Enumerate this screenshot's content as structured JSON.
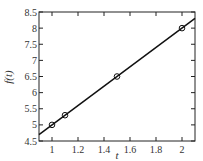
{
  "chart_data": {
    "type": "line",
    "title": "",
    "xlabel": "t",
    "ylabel": "f(t)",
    "xlim": [
      0.9,
      2.1
    ],
    "ylim": [
      4.5,
      8.5
    ],
    "grid": false,
    "legend": null,
    "x_ticks": [
      1,
      1.2,
      1.4,
      1.6,
      1.8,
      2
    ],
    "x_tick_labels": [
      "1",
      "1.2",
      "1.4",
      "1.6",
      "1.8",
      "2"
    ],
    "y_ticks": [
      4.5,
      5,
      5.5,
      6,
      6.5,
      7,
      7.5,
      8,
      8.5
    ],
    "y_tick_labels": [
      "4.5",
      "5",
      "5.5",
      "6",
      "6.5",
      "7",
      "7.5",
      "8",
      "8.5"
    ],
    "series": [
      {
        "name": "fit line",
        "style": "solid line",
        "color": "#111111",
        "x": [
          0.9,
          2.1
        ],
        "y": [
          4.7,
          8.3
        ]
      },
      {
        "name": "data points",
        "style": "open circle markers",
        "color": "#111111",
        "x": [
          1.0,
          1.1,
          1.5,
          2.0
        ],
        "y": [
          5.0,
          5.3,
          6.5,
          8.0
        ]
      }
    ]
  }
}
